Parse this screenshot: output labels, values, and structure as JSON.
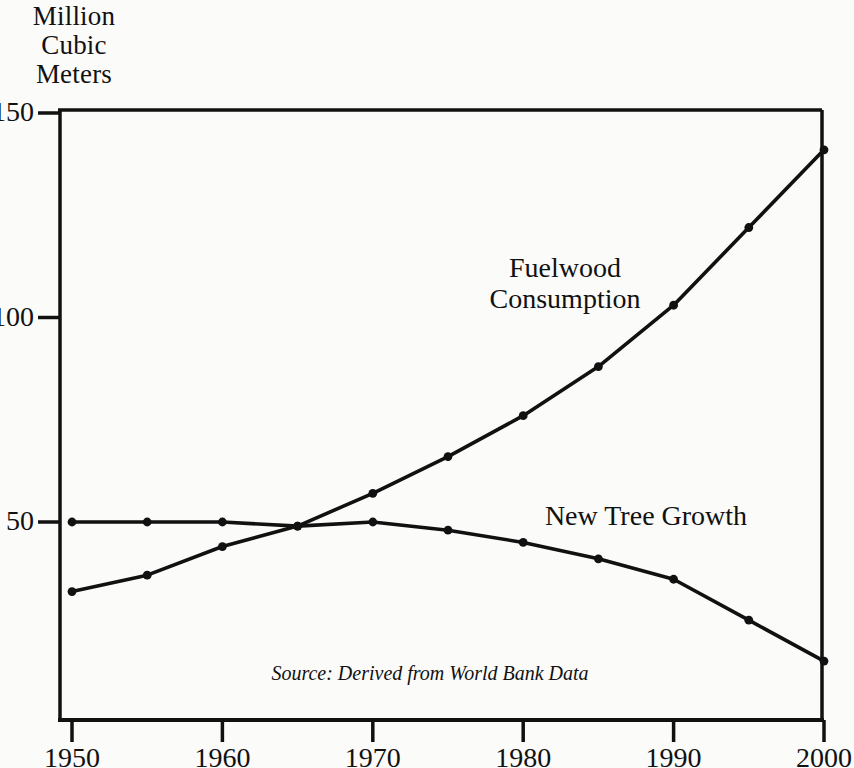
{
  "figure": {
    "background_color": "#fbfbfa",
    "ink_color": "#111111"
  },
  "axis_title": {
    "line1": "Million",
    "line2": "Cubic",
    "line3": "Meters"
  },
  "source_note": "Source: Derived from World Bank Data",
  "labels": {
    "fuelwood_line1": "Fuelwood",
    "fuelwood_line2": "Consumption",
    "new_tree_growth": "New Tree Growth"
  },
  "y_ticks": [
    {
      "value": 150,
      "label": "150"
    },
    {
      "value": 100,
      "label": "100"
    },
    {
      "value": 50,
      "label": "50"
    }
  ],
  "x_ticks": [
    {
      "value": 1950,
      "label": "1950"
    },
    {
      "value": 1960,
      "label": "1960"
    },
    {
      "value": 1970,
      "label": "1970"
    },
    {
      "value": 1980,
      "label": "1980"
    },
    {
      "value": 1990,
      "label": "1990"
    },
    {
      "value": 2000,
      "label": "2000"
    }
  ],
  "chart_data": {
    "type": "line",
    "title": "",
    "xlabel": "",
    "ylabel": "Million Cubic Meters",
    "xlim": [
      1950,
      2000
    ],
    "ylim": [
      0,
      150
    ],
    "grid": false,
    "legend": "inline-annotations",
    "x": [
      1950,
      1955,
      1960,
      1965,
      1970,
      1975,
      1980,
      1985,
      1990,
      1995,
      2000
    ],
    "series": [
      {
        "name": "Fuelwood Consumption",
        "values": [
          33,
          37,
          44,
          49,
          57,
          66,
          76,
          88,
          103,
          122,
          141
        ],
        "marker": "dot",
        "color": "#111111"
      },
      {
        "name": "New Tree Growth",
        "values": [
          50,
          50,
          50,
          49,
          50,
          48,
          45,
          41,
          36,
          26,
          16
        ],
        "marker": "dot",
        "color": "#111111"
      }
    ],
    "annotations": [
      {
        "text": "Fuelwood Consumption",
        "series": "Fuelwood Consumption"
      },
      {
        "text": "New Tree Growth",
        "series": "New Tree Growth"
      },
      {
        "text": "Source: Derived from World Bank Data",
        "position": "bottom-center"
      }
    ]
  },
  "geometry": {
    "plot_left_px": 60,
    "plot_right_px": 822,
    "plot_top_px": 110,
    "plot_bottom_px": 720,
    "x_origin_px": 72,
    "x_end_px": 824,
    "y_150_px": 113,
    "y_100_px": 313,
    "y_50_px": 522
  }
}
